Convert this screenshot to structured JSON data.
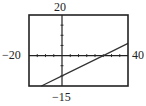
{
  "chart_data": {
    "type": "line",
    "title": "",
    "xlabel": "",
    "ylabel": "",
    "xlim": [
      -20,
      40
    ],
    "ylim": [
      -15,
      20
    ],
    "xscale": 5,
    "yscale": 5,
    "grid": false,
    "window_labels": {
      "xmin": "−20",
      "xmax": "40",
      "ymin": "−15",
      "ymax": "20"
    },
    "series": [
      {
        "name": "line",
        "equation_estimate": "y = 0.4x - 10",
        "x": [
          -12.5,
          0,
          25,
          40
        ],
        "y": [
          -15,
          -10,
          0,
          6
        ]
      }
    ],
    "colors": {
      "frame": "#222222",
      "axes": "#222222",
      "line": "#333333"
    }
  }
}
